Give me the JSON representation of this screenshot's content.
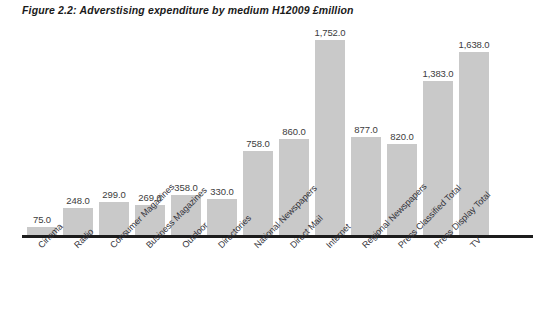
{
  "chart_data": {
    "type": "bar",
    "title": "Figure 2.2: Adverstising expenditure by medium H12009 £million",
    "xlabel": "",
    "ylabel": "",
    "ylim": [
      0,
      1752
    ],
    "grid": false,
    "legend": "none",
    "axis_color": "#1c1c1c",
    "bar_color": "#c9c9c9",
    "value_label_format": "comma-one-decimal",
    "categories": [
      "Cinema",
      "Radio",
      "Consumer Magazines",
      "Business Magazines",
      "Outdoor",
      "Directories",
      "National Newspapers",
      "Direct Mail",
      "Internet",
      "Regional Newspapers",
      "Press Classified Total",
      "Press Display Total",
      "TV"
    ],
    "values": [
      75.0,
      248.0,
      299.0,
      269.0,
      358.0,
      330.0,
      758.0,
      860.0,
      1752.0,
      877.0,
      820.0,
      1383.0,
      1638.0
    ],
    "value_labels": [
      "75.0",
      "248.0",
      "299.0",
      "269.0",
      "358.0",
      "330.0",
      "758.0",
      "860.0",
      "1,752.0",
      "877.0",
      "820.0",
      "1,383.0",
      "1,638.0"
    ]
  }
}
